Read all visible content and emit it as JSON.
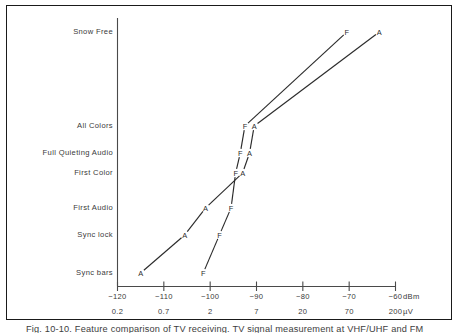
{
  "figure": {
    "caption": "Fig. 10-10.  Feature comparison of TV receiving.  TV signal measurement at VHF/UHF and FM"
  },
  "chart_data": {
    "type": "line",
    "title": "",
    "xlabel": "dBm",
    "xlabel_secondary": "µV",
    "ylabel": "",
    "grid": false,
    "legend": "none",
    "x_axis": {
      "unit_primary": "dBm",
      "unit_secondary": "µV",
      "ticks_dbm": [
        -120,
        -110,
        -100,
        -90,
        -80,
        -70,
        -60
      ],
      "tick_labels_dbm": [
        "−120",
        "−110",
        "−100",
        "−90",
        "−80",
        "−70",
        "−60"
      ],
      "tick_labels_uv": [
        "0.2",
        "0.7",
        "2",
        "7",
        "20",
        "70",
        "200"
      ],
      "xlim": [
        -120,
        -60
      ]
    },
    "y_axis": {
      "type": "categorical",
      "categories": [
        "Snow Free",
        "All Colors",
        "Full Quieting Audio",
        "First Color",
        "First Audio",
        "Sync lock",
        "Sync bars"
      ]
    },
    "series": [
      {
        "name": "A",
        "marker_label": "A",
        "points": [
          {
            "label": "A",
            "x_dbm": -115.0,
            "y_cat": "Sync bars"
          },
          {
            "label": "A",
            "x_dbm": -105.5,
            "y_cat": "Sync lock"
          },
          {
            "label": "A",
            "x_dbm": -101.0,
            "y_cat": "First Audio"
          },
          {
            "label": "A",
            "x_dbm": -93.0,
            "y_cat": "First Color"
          },
          {
            "label": "A",
            "x_dbm": -91.5,
            "y_cat": "Full Quieting Audio"
          },
          {
            "label": "A",
            "x_dbm": -90.5,
            "y_cat": "All Colors"
          },
          {
            "label": "A",
            "x_dbm": -63.5,
            "y_cat": "Snow Free"
          }
        ]
      },
      {
        "name": "F",
        "marker_label": "F",
        "points": [
          {
            "label": "F",
            "x_dbm": -101.5,
            "y_cat": "Sync bars"
          },
          {
            "label": "F",
            "x_dbm": -98.0,
            "y_cat": "Sync lock"
          },
          {
            "label": "F",
            "x_dbm": -95.5,
            "y_cat": "First Audio"
          },
          {
            "label": "F",
            "x_dbm": -94.5,
            "y_cat": "First Color"
          },
          {
            "label": "F",
            "x_dbm": -93.5,
            "y_cat": "Full Quieting Audio"
          },
          {
            "label": "F",
            "x_dbm": -92.5,
            "y_cat": "All Colors"
          },
          {
            "label": "F",
            "x_dbm": -70.5,
            "y_cat": "Snow Free"
          }
        ]
      }
    ],
    "colors": {
      "line": "#2b2b2b",
      "axis": "#4a4a4a",
      "text": "#3a3a3a",
      "frame": "#1a1a1a",
      "background": "#ffffff"
    }
  }
}
